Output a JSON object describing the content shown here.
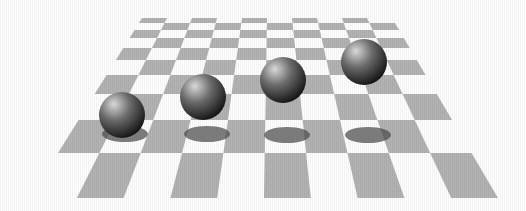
{
  "scene": {
    "title": "Four spheres floating above a checkerboard plane",
    "background_color": "#ffffff",
    "board": {
      "columns": 10,
      "rows": 10,
      "dark_color": "#b3b3b3",
      "light_color": "#ffffff"
    },
    "spheres": [
      {
        "name": "sphere-1",
        "order": 1
      },
      {
        "name": "sphere-2",
        "order": 2
      },
      {
        "name": "sphere-3",
        "order": 3
      },
      {
        "name": "sphere-4",
        "order": 4
      }
    ],
    "sphere_colors": {
      "highlight": "#d9d9d9",
      "mid": "#6b6b6b",
      "dark": "#111111"
    },
    "shadow_color": "#4a4a4a"
  }
}
